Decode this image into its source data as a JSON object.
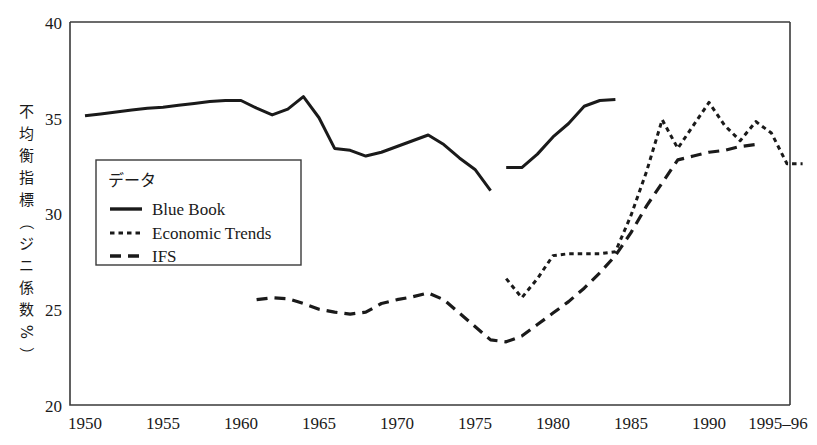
{
  "chart_data": {
    "type": "line",
    "title": "",
    "xlabel": "",
    "ylabel": "不均衡指標（ジニ係数%）",
    "xlim": [
      1950,
      1996
    ],
    "ylim": [
      20,
      40
    ],
    "grid": false,
    "legend_position": "upper-left-inside",
    "legend_title": "データ",
    "x_tick_labels": [
      "1950",
      "1955",
      "1960",
      "1965",
      "1970",
      "1975",
      "1980",
      "1985",
      "1990",
      "1995–96"
    ],
    "x_tick_values": [
      1950,
      1955,
      1960,
      1965,
      1970,
      1975,
      1980,
      1985,
      1990,
      1995.5
    ],
    "y_tick_labels": [
      "20",
      "25",
      "30",
      "35",
      "40"
    ],
    "y_tick_values": [
      20,
      25,
      30,
      35,
      40
    ],
    "series": [
      {
        "name": "Blue Book",
        "style": "solid",
        "segments": [
          {
            "x": [
              1950,
              1951,
              1952,
              1953,
              1954,
              1955,
              1956,
              1957,
              1958,
              1959,
              1960,
              1961,
              1962,
              1963,
              1964,
              1965,
              1966,
              1967,
              1968,
              1969,
              1970,
              1971,
              1972,
              1973,
              1974,
              1975,
              1976
            ],
            "y": [
              35.1,
              35.2,
              35.3,
              35.4,
              35.5,
              35.55,
              35.65,
              35.75,
              35.85,
              35.9,
              35.9,
              35.5,
              35.15,
              35.45,
              36.1,
              35.0,
              33.4,
              33.3,
              33.0,
              33.2,
              33.5,
              33.8,
              34.1,
              33.6,
              32.9,
              32.3,
              31.2
            ]
          },
          {
            "x": [
              1977,
              1978,
              1979,
              1980,
              1981,
              1982,
              1983,
              1984
            ],
            "y": [
              32.4,
              32.4,
              33.1,
              34.0,
              34.7,
              35.6,
              35.9,
              35.95
            ]
          }
        ]
      },
      {
        "name": "Economic Trends",
        "style": "dotted",
        "segments": [
          {
            "x": [
              1977,
              1978,
              1979,
              1980,
              1981,
              1982,
              1983,
              1984,
              1985,
              1986,
              1987,
              1988,
              1989,
              1990,
              1991,
              1992,
              1993,
              1994,
              1995,
              1996
            ],
            "y": [
              26.6,
              25.6,
              26.6,
              27.8,
              27.9,
              27.9,
              27.9,
              28.0,
              29.9,
              32.2,
              34.9,
              33.4,
              34.6,
              35.8,
              34.6,
              33.8,
              34.8,
              34.2,
              32.6,
              32.6
            ]
          }
        ]
      },
      {
        "name": "IFS",
        "style": "dashed",
        "segments": [
          {
            "x": [
              1961,
              1962,
              1963,
              1964,
              1965,
              1966,
              1967,
              1968,
              1969,
              1970,
              1971,
              1972,
              1973,
              1974,
              1975,
              1976,
              1977,
              1978,
              1979,
              1980,
              1981,
              1982,
              1983,
              1984,
              1985,
              1986,
              1987,
              1988,
              1989,
              1990,
              1991,
              1992,
              1993
            ],
            "y": [
              25.5,
              25.6,
              25.55,
              25.3,
              25.0,
              24.85,
              24.75,
              24.85,
              25.3,
              25.5,
              25.65,
              25.85,
              25.5,
              24.8,
              24.1,
              23.4,
              23.3,
              23.6,
              24.2,
              24.8,
              25.4,
              26.1,
              26.9,
              27.8,
              29.0,
              30.4,
              31.6,
              32.8,
              33.0,
              33.2,
              33.3,
              33.5,
              33.6
            ]
          }
        ]
      }
    ]
  },
  "axis": {
    "y_label_chars": [
      "不",
      "均",
      "衡",
      "指",
      "標",
      "（",
      "ジ",
      "ニ",
      "係",
      "数",
      "%",
      "）"
    ]
  },
  "legend": {
    "title": "データ",
    "items": [
      {
        "label": "Blue Book",
        "style": "solid"
      },
      {
        "label": "Economic Trends",
        "style": "dotted"
      },
      {
        "label": "IFS",
        "style": "dashed"
      }
    ]
  },
  "colors": {
    "ink": "#1a1a1a",
    "axis": "#3a3a3a",
    "background": "#ffffff"
  }
}
